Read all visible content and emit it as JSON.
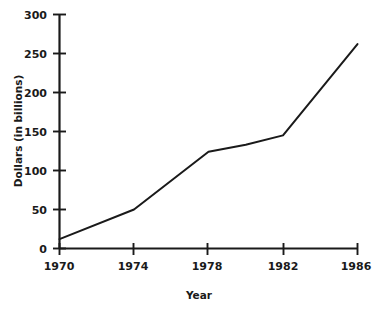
{
  "chart_data": {
    "type": "line",
    "title": "",
    "xlabel": "Year",
    "ylabel": "Dollars (in billions)",
    "x": [
      1970,
      1974,
      1978,
      1980,
      1982,
      1986
    ],
    "values": [
      12,
      50,
      124,
      133,
      145,
      262
    ],
    "series": [
      {
        "name": "Dollars (in billions)",
        "values": [
          12,
          50,
          124,
          133,
          145,
          262
        ]
      }
    ],
    "xlim": [
      1970,
      1986
    ],
    "ylim": [
      0,
      300
    ],
    "xticks": [
      1970,
      1974,
      1978,
      1982,
      1986
    ],
    "xtick_labels": [
      "1970",
      "1974",
      "1978",
      "1982",
      "1986"
    ],
    "yticks": [
      0,
      50,
      100,
      150,
      200,
      250,
      300
    ],
    "ytick_labels": [
      "0",
      "50",
      "100",
      "150",
      "200",
      "250",
      "300"
    ],
    "grid": false,
    "legend": false,
    "legend_position": "none",
    "line_color": "#1a1a1a",
    "background_color": "#ffffff",
    "annotations": []
  },
  "axes": {
    "x_title": "Year",
    "y_title": "Dollars (in billions)"
  },
  "ticks": {
    "y": [
      {
        "label": "300",
        "value": 300
      },
      {
        "label": "250",
        "value": 250
      },
      {
        "label": "200",
        "value": 200
      },
      {
        "label": "150",
        "value": 150
      },
      {
        "label": "100",
        "value": 100
      },
      {
        "label": "50",
        "value": 50
      },
      {
        "label": "0",
        "value": 0
      }
    ],
    "x": [
      {
        "label": "1970",
        "value": 1970
      },
      {
        "label": "1974",
        "value": 1974
      },
      {
        "label": "1978",
        "value": 1978
      },
      {
        "label": "1982",
        "value": 1982
      },
      {
        "label": "1986",
        "value": 1986
      }
    ]
  }
}
